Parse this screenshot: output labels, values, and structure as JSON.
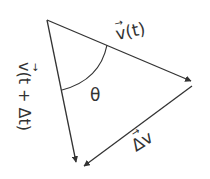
{
  "diagram": {
    "type": "vector-triangle",
    "labels": {
      "v_t": "v(t)",
      "v_t_dt": "v(t + Δt)",
      "delta_v": "Δv",
      "angle": "θ"
    },
    "vector_arrow_glyph": "→",
    "colors": {
      "stroke": "#333333",
      "background": "#ffffff"
    }
  }
}
